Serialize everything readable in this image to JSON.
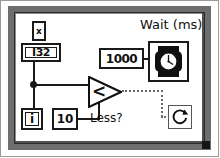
{
  "diagram": {
    "loop_type": "while-loop"
  },
  "nodes": {
    "multiply_terminal": {
      "label": "x",
      "name": "multiply-terminal"
    },
    "representation": {
      "label": "I32",
      "name": "i32-representation-node"
    },
    "iteration_terminal": {
      "label": "i",
      "name": "iteration-terminal"
    },
    "limit_constant": {
      "label": "10",
      "name": "numeric-constant-10"
    },
    "wait_constant": {
      "label": "1000",
      "name": "numeric-constant-1000"
    },
    "wait_function": {
      "label": "Wait (ms)",
      "icon": "wristwatch-icon",
      "name": "wait-ms-function"
    },
    "comparison": {
      "label": "<",
      "caption": "Less?",
      "name": "less-than-function"
    },
    "conditional_terminal": {
      "icon": "loop-continue-icon",
      "name": "conditional-terminal"
    }
  },
  "colors": {
    "wire": "#1a1a1a",
    "boolean_wire": "#6a6a6a",
    "loop_border": "#6e6e6e",
    "background": "#ffffff",
    "outline": "#1a1a1a"
  }
}
